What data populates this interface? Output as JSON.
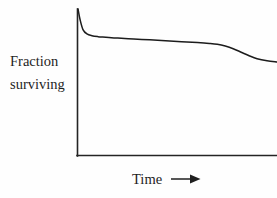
{
  "figure": {
    "background_color": "#fefefe",
    "line_color": "#1c1c1c",
    "axis_color": "#242424",
    "y_axis_label_line1": "Fraction",
    "y_axis_label_line2": "surviving",
    "x_axis_label": "Time",
    "x_axis_arrow_icon": "arrow-right-icon"
  },
  "chart_data": {
    "type": "line",
    "title": "",
    "subtitle": "",
    "xlabel": "Time",
    "ylabel": "Fraction surviving",
    "grid": false,
    "legend": null,
    "legend_position": "none",
    "axis_ticks": {
      "x": [],
      "y": []
    },
    "axis_style": "open-left-bottom-spines-only",
    "xlim": [
      0,
      1
    ],
    "ylim": [
      0,
      1
    ],
    "annotations": [
      {
        "text": "Time",
        "type": "axis-label",
        "position": "below-x-axis"
      },
      {
        "text": "Fraction surviving",
        "type": "axis-label",
        "position": "left-of-y-axis"
      },
      {
        "text": "arrow-right-icon",
        "type": "direction-arrow",
        "position": "right-of-x-axis-label"
      }
    ],
    "series": [
      {
        "name": "Fraction surviving",
        "x": [
          0.0,
          0.01,
          0.025,
          0.045,
          0.07,
          0.1,
          0.14,
          0.2,
          0.28,
          0.36,
          0.44,
          0.52,
          0.6,
          0.66,
          0.7,
          0.74,
          0.78,
          0.82,
          0.86,
          0.9,
          0.95,
          1.0
        ],
        "y": [
          1.0,
          0.93,
          0.86,
          0.83,
          0.818,
          0.812,
          0.808,
          0.802,
          0.796,
          0.79,
          0.784,
          0.778,
          0.772,
          0.766,
          0.76,
          0.748,
          0.73,
          0.706,
          0.682,
          0.662,
          0.648,
          0.64
        ]
      }
    ],
    "pixel_geometry": {
      "y_axis_x": 77,
      "y_axis_top_y": 9,
      "x_axis_y": 156,
      "x_axis_right_x": 277,
      "curve_start": [
        78,
        9
      ],
      "curve_end": [
        277,
        59
      ]
    }
  }
}
